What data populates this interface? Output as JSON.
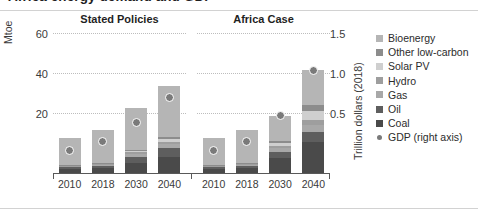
{
  "title": "Africa energy demand and GDP",
  "axes": {
    "left_title": "Mtoe",
    "right_title": "Trillion dollars (2018)",
    "left_ticks": [
      "60",
      "40",
      "20"
    ],
    "right_ticks": [
      "1.5",
      "1.0",
      "0.5"
    ]
  },
  "panels": [
    {
      "header": "Stated Policies"
    },
    {
      "header": "Africa Case"
    }
  ],
  "chart_data": {
    "type": "bar",
    "title": "Africa energy demand and GDP",
    "xlabel": "",
    "ylabel": "Mtoe",
    "y2label": "Trillion dollars (2018)",
    "ylim": [
      0,
      70
    ],
    "y2lim": [
      0,
      1.75
    ],
    "yticks": [
      20,
      40,
      60
    ],
    "y2ticks": [
      0.5,
      1.0,
      1.5
    ],
    "grid": true,
    "stacked": true,
    "legend_position": "right",
    "categories": [
      "2010",
      "2018",
      "2030",
      "2040"
    ],
    "panels": [
      {
        "name": "Stated Policies",
        "series": [
          {
            "name": "Coal",
            "values": [
              2.0,
              2.5,
              5.0,
              8.0
            ]
          },
          {
            "name": "Oil",
            "values": [
              0.8,
              1.0,
              3.0,
              4.5
            ]
          },
          {
            "name": "Gas",
            "values": [
              0.5,
              0.6,
              1.5,
              2.0
            ]
          },
          {
            "name": "Hydro",
            "values": [
              0.4,
              0.5,
              0.8,
              1.0
            ]
          },
          {
            "name": "Solar PV",
            "values": [
              0.1,
              0.3,
              0.8,
              1.5
            ]
          },
          {
            "name": "Other low-carbon",
            "values": [
              0.2,
              0.3,
              0.6,
              1.0
            ]
          },
          {
            "name": "Bioenergy",
            "values": [
              13.5,
              16.3,
              20.8,
              25.5
            ]
          }
        ],
        "totals": [
          17.5,
          21.5,
          32.5,
          43.5
        ],
        "gdp": [
          0.28,
          0.4,
          0.63,
          0.95
        ]
      },
      {
        "name": "Africa Case",
        "series": [
          {
            "name": "Coal",
            "values": [
              2.0,
              2.5,
              7.5,
              15.5
            ]
          },
          {
            "name": "Oil",
            "values": [
              0.8,
              1.0,
              3.0,
              5.0
            ]
          },
          {
            "name": "Gas",
            "values": [
              0.5,
              0.6,
              2.0,
              3.5
            ]
          },
          {
            "name": "Hydro",
            "values": [
              0.4,
              0.5,
              1.2,
              2.5
            ]
          },
          {
            "name": "Solar PV",
            "values": [
              0.1,
              0.3,
              1.5,
              4.5
            ]
          },
          {
            "name": "Other low-carbon",
            "values": [
              0.2,
              0.3,
              1.0,
              3.0
            ]
          },
          {
            "name": "Bioenergy",
            "values": [
              13.5,
              16.3,
              12.3,
              17.5
            ]
          }
        ],
        "totals": [
          17.5,
          21.5,
          28.5,
          51.5
        ],
        "gdp": [
          0.28,
          0.4,
          0.72,
          1.28
        ]
      }
    ],
    "legend": [
      {
        "name": "Bioenergy",
        "color": "#b5b5b5"
      },
      {
        "name": "Other low-carbon",
        "color": "#8c8c8c"
      },
      {
        "name": "Solar PV",
        "color": "#cfcfcf"
      },
      {
        "name": "Hydro",
        "color": "#9e9e9e"
      },
      {
        "name": "Gas",
        "color": "#a8a8a8"
      },
      {
        "name": "Oil",
        "color": "#5e5e5e"
      },
      {
        "name": "Coal",
        "color": "#4a4a4a"
      },
      {
        "name": "GDP (right axis)",
        "color": "#7a7a7a"
      }
    ]
  },
  "xlabels": [
    "2010",
    "2018",
    "2030",
    "2040",
    "2010",
    "2018",
    "2030",
    "2040"
  ]
}
